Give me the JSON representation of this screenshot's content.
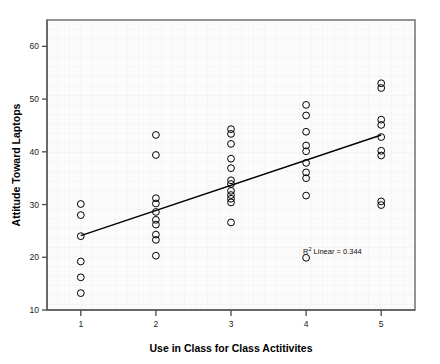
{
  "chart_data": {
    "type": "scatter",
    "title": "",
    "xlabel": "Use in Class for Class Actitivites",
    "ylabel": "Attitude Toward Laptops",
    "xlim": [
      0.55,
      5.45
    ],
    "ylim": [
      10,
      65
    ],
    "xticks": [
      1,
      2,
      3,
      4,
      5
    ],
    "xtick_labels": [
      "1",
      "2",
      "3",
      "4",
      "5"
    ],
    "yticks": [
      10,
      20,
      30,
      40,
      50,
      60
    ],
    "ytick_labels": [
      "10",
      "20",
      "30",
      "40",
      "50",
      "60"
    ],
    "grid": true,
    "legend": "none",
    "marker": "open-circle",
    "marker_color": "#000000",
    "marker_size": 4.4,
    "points": [
      {
        "x": 1,
        "y": 30.1
      },
      {
        "x": 1,
        "y": 28.0
      },
      {
        "x": 1,
        "y": 24.0
      },
      {
        "x": 1,
        "y": 19.2
      },
      {
        "x": 1,
        "y": 16.2
      },
      {
        "x": 1,
        "y": 13.2
      },
      {
        "x": 2,
        "y": 43.2
      },
      {
        "x": 2,
        "y": 39.4
      },
      {
        "x": 2,
        "y": 31.2
      },
      {
        "x": 2,
        "y": 30.2
      },
      {
        "x": 2,
        "y": 28.6
      },
      {
        "x": 2,
        "y": 27.1
      },
      {
        "x": 2,
        "y": 26.2
      },
      {
        "x": 2,
        "y": 24.3
      },
      {
        "x": 2,
        "y": 23.3
      },
      {
        "x": 2,
        "y": 20.3
      },
      {
        "x": 3,
        "y": 44.3
      },
      {
        "x": 3,
        "y": 43.4
      },
      {
        "x": 3,
        "y": 41.5
      },
      {
        "x": 3,
        "y": 38.7
      },
      {
        "x": 3,
        "y": 36.9
      },
      {
        "x": 3,
        "y": 34.6
      },
      {
        "x": 3,
        "y": 33.9
      },
      {
        "x": 3,
        "y": 32.6
      },
      {
        "x": 3,
        "y": 31.8
      },
      {
        "x": 3,
        "y": 31.1
      },
      {
        "x": 3,
        "y": 30.4
      },
      {
        "x": 3,
        "y": 26.6
      },
      {
        "x": 4,
        "y": 48.9
      },
      {
        "x": 4,
        "y": 46.9
      },
      {
        "x": 4,
        "y": 43.8
      },
      {
        "x": 4,
        "y": 41.2
      },
      {
        "x": 4,
        "y": 40.1
      },
      {
        "x": 4,
        "y": 37.9
      },
      {
        "x": 4,
        "y": 36.1
      },
      {
        "x": 4,
        "y": 35.0
      },
      {
        "x": 4,
        "y": 31.7
      },
      {
        "x": 4,
        "y": 19.9
      },
      {
        "x": 5,
        "y": 53.0
      },
      {
        "x": 5,
        "y": 52.1
      },
      {
        "x": 5,
        "y": 46.1
      },
      {
        "x": 5,
        "y": 45.1
      },
      {
        "x": 5,
        "y": 42.8
      },
      {
        "x": 5,
        "y": 40.2
      },
      {
        "x": 5,
        "y": 39.3
      },
      {
        "x": 5,
        "y": 30.6
      },
      {
        "x": 5,
        "y": 29.9
      }
    ],
    "fit_line": {
      "type": "linear",
      "x_start": 1,
      "y_start": 24.1,
      "x_end": 5,
      "y_end": 43.2,
      "color": "#000000"
    },
    "annotations": [
      {
        "name": "r-squared-label",
        "prefix": "R",
        "superscript": "2",
        "text": " Linear = 0.344",
        "x": 4.35,
        "y": 20.6
      }
    ]
  },
  "colors": {
    "frame": "#7a7a7a",
    "grid": "#e8e8e8",
    "panel": "#fbfbfb",
    "ink": "#000000"
  }
}
